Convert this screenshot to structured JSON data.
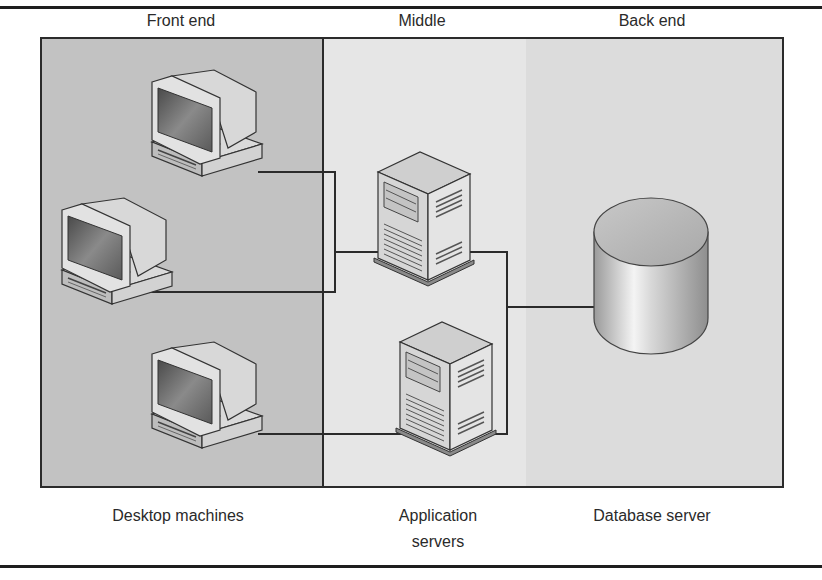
{
  "diagram": {
    "tiers": [
      {
        "id": "front",
        "header": "Front end",
        "footer": "Desktop machines",
        "fill": "#c2c2c2"
      },
      {
        "id": "middle",
        "header": "Middle",
        "footer_line1": "Application",
        "footer_line2": "servers",
        "fill": "#e6e6e6"
      },
      {
        "id": "back",
        "header": "Back end",
        "footer": "Database server",
        "fill": "#dcdcdc"
      }
    ],
    "nodes": [
      {
        "id": "desktop-1",
        "type": "desktop-computer-icon",
        "tier": "front"
      },
      {
        "id": "desktop-2",
        "type": "desktop-computer-icon",
        "tier": "front"
      },
      {
        "id": "desktop-3",
        "type": "desktop-computer-icon",
        "tier": "front"
      },
      {
        "id": "app-server-1",
        "type": "tower-server-icon",
        "tier": "middle"
      },
      {
        "id": "app-server-2",
        "type": "tower-server-icon",
        "tier": "middle"
      },
      {
        "id": "database",
        "type": "database-cylinder-icon",
        "tier": "back"
      }
    ],
    "edges": [
      {
        "from": "desktop-1",
        "to": "app-server-1"
      },
      {
        "from": "desktop-2",
        "to": "app-server-1"
      },
      {
        "from": "desktop-3",
        "to": "app-server-2"
      },
      {
        "from": "app-server-1",
        "to": "database"
      },
      {
        "from": "app-server-2",
        "to": "database"
      }
    ],
    "colors": {
      "line": "#2b2b2b",
      "rule": "#1e1e1e"
    }
  }
}
